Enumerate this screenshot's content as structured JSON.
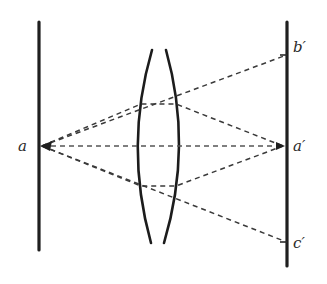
{
  "figure": {
    "type": "optics-lens-diagram",
    "colors": {
      "ink": "#1f1f1f",
      "dashed_ray": "#3a3a3a",
      "background": "#ffffff"
    },
    "labels": {
      "source_point": "a",
      "image_top": "b′",
      "image_center": "a′",
      "image_bottom": "c′"
    },
    "elements": {
      "left_screen": {
        "x": 39,
        "y_top": 22,
        "y_bottom": 250
      },
      "right_screen": {
        "x": 287,
        "y_top": 22,
        "y_bottom": 266
      },
      "lens": {
        "center_x": 158,
        "top_y": 50,
        "bottom_y": 243,
        "left_bulge_x": 137,
        "right_bulge_x": 180
      },
      "points": {
        "a": [
          41,
          146
        ],
        "b_prime": [
          285,
          55
        ],
        "a_prime": [
          285,
          146
        ],
        "c_prime": [
          285,
          242
        ]
      }
    }
  }
}
